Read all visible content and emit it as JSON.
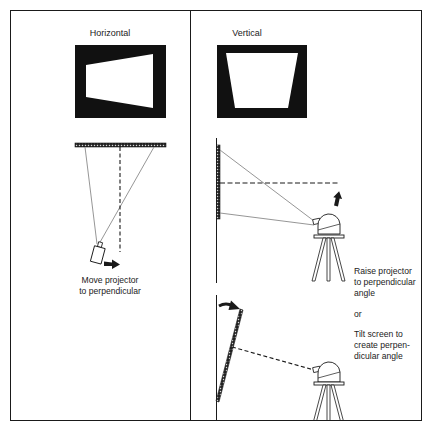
{
  "panels": [
    {
      "id": "horizontal",
      "title": "Horizontal",
      "caption_lines": [
        "Move projector",
        "to perpendicular"
      ]
    },
    {
      "id": "vertical",
      "title": "Vertical",
      "captions": {
        "raise_lines": [
          "Raise projector",
          "to perpendicular",
          "angle"
        ],
        "or": "or",
        "tilt_lines": [
          "Tilt screen to",
          "create perpen-",
          "dicular angle"
        ]
      }
    }
  ],
  "colors": {
    "ink": "#1a1a1a",
    "screen_fill": "#111111",
    "projection_line": "#8a8a8a",
    "background": "#ffffff"
  }
}
